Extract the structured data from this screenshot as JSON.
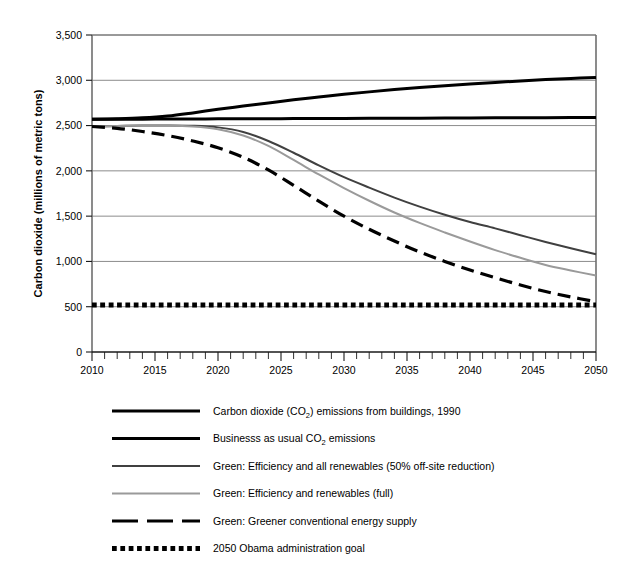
{
  "chart_data": {
    "type": "line",
    "title": "",
    "xlabel": "",
    "ylabel": "Carbon dioxide (millions of metric tons)",
    "xlim": [
      2010,
      2050
    ],
    "ylim": [
      0,
      3500
    ],
    "grid": true,
    "legend_position": "below",
    "x_tick_labels": [
      "2010",
      "2015",
      "2020",
      "2025",
      "2030",
      "2035",
      "2040",
      "2045",
      "2050"
    ],
    "x_tick_values": [
      2010,
      2015,
      2020,
      2025,
      2030,
      2035,
      2040,
      2045,
      2050
    ],
    "x_minor_tick_step": 1,
    "y_tick_labels": [
      "0",
      "500",
      "1,000",
      "1,500",
      "2,000",
      "2,500",
      "3,000",
      "3,500"
    ],
    "y_tick_values": [
      0,
      500,
      1000,
      1500,
      2000,
      2500,
      3000,
      3500
    ],
    "x": [
      2010,
      2012,
      2014,
      2016,
      2018,
      2020,
      2022,
      2024,
      2026,
      2028,
      2030,
      2032,
      2034,
      2036,
      2038,
      2040,
      2042,
      2044,
      2046,
      2048,
      2050
    ],
    "series": [
      {
        "name": "Carbon dioxide (CO2) emissions from buildings, 1990",
        "label_main": "Carbon dioxide (CO",
        "label_sub": "2",
        "label_tail": ") emissions from buildings, 1990",
        "color": "#000000",
        "style": "solid",
        "width": 3,
        "values": [
          2570,
          2575,
          2585,
          2605,
          2640,
          2680,
          2715,
          2750,
          2785,
          2815,
          2845,
          2872,
          2897,
          2920,
          2940,
          2958,
          2975,
          2993,
          3008,
          3020,
          3030
        ]
      },
      {
        "name": "Businesss as usual CO2 emissions",
        "label_main": "Businesss as usual CO",
        "label_sub": "2",
        "label_tail": " emissions",
        "color": "#000000",
        "style": "solid",
        "width": 3,
        "values": [
          2570,
          2570,
          2571,
          2572,
          2573,
          2574,
          2575,
          2576,
          2577,
          2578,
          2579,
          2580,
          2581,
          2582,
          2583,
          2584,
          2585,
          2586,
          2587,
          2588,
          2589
        ]
      },
      {
        "name": "Green: Efficiency and all renewables (50% off-site reduction)",
        "label_main": "Green: Efficiency and all renewables (50% off-site reduction)",
        "label_sub": "",
        "label_tail": "",
        "color": "#404040",
        "style": "solid",
        "width": 2,
        "values": [
          2490,
          2495,
          2500,
          2502,
          2498,
          2480,
          2430,
          2330,
          2200,
          2060,
          1930,
          1815,
          1705,
          1605,
          1515,
          1435,
          1365,
          1290,
          1215,
          1145,
          1080
        ]
      },
      {
        "name": "Green: Efficiency and renewables (full)",
        "label_main": "Green: Efficiency and renewables (full)",
        "label_sub": "",
        "label_tail": "",
        "color": "#9a9a9a",
        "style": "solid",
        "width": 2,
        "values": [
          2490,
          2495,
          2500,
          2500,
          2490,
          2460,
          2390,
          2275,
          2120,
          1960,
          1810,
          1670,
          1540,
          1425,
          1320,
          1220,
          1125,
          1040,
          960,
          900,
          845
        ]
      },
      {
        "name": "Green: Greener conventional energy supply",
        "label_main": "Green: Greener conventional energy supply",
        "label_sub": "",
        "label_tail": "",
        "color": "#000000",
        "style": "dashed",
        "width": 3.2,
        "values": [
          2490,
          2470,
          2435,
          2390,
          2330,
          2255,
          2150,
          2010,
          1840,
          1665,
          1500,
          1355,
          1225,
          1105,
          1000,
          905,
          820,
          740,
          668,
          608,
          555
        ]
      },
      {
        "name": "2050 Obama administration goal",
        "label_main": "2050 Obama administration goal",
        "label_sub": "",
        "label_tail": "",
        "color": "#000000",
        "style": "dotted",
        "width": 5,
        "values": [
          520,
          520,
          520,
          520,
          520,
          520,
          520,
          520,
          520,
          520,
          520,
          520,
          520,
          520,
          520,
          520,
          520,
          520,
          520,
          520,
          520
        ]
      }
    ]
  },
  "legend": {
    "items": [
      {
        "label": "Carbon dioxide (CO2) emissions from buildings, 1990"
      },
      {
        "label": "Businesss as usual CO2 emissions"
      },
      {
        "label": "Green: Efficiency and all renewables (50% off-site reduction)"
      },
      {
        "label": "Green: Efficiency and renewables (full)"
      },
      {
        "label": "Green: Greener conventional energy supply"
      },
      {
        "label": "2050 Obama administration goal"
      }
    ]
  }
}
